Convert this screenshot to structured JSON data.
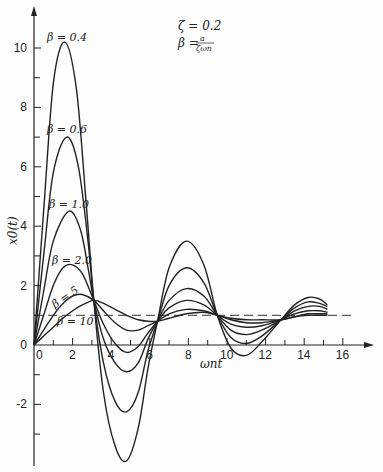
{
  "chart_data": {
    "type": "line",
    "title": "",
    "xlabel": "ωnt",
    "ylabel": "x0(t)",
    "xlim": [
      0,
      17
    ],
    "ylim": [
      -4,
      11
    ],
    "grid": false,
    "legend": "inline labels near first peaks",
    "x_ticks": [
      0,
      2,
      4,
      6,
      8,
      10,
      12,
      14,
      16
    ],
    "x_tick_labels": [
      "0",
      "2",
      "4",
      "6",
      "8",
      "10",
      "12",
      "14",
      "16"
    ],
    "y_ticks": [
      -2,
      0,
      2,
      4,
      6,
      8,
      10
    ],
    "y_tick_labels": [
      "-2",
      "0",
      "2",
      "4",
      "6",
      "8",
      "10"
    ],
    "annotations": [
      {
        "text": "ζ = 0.2",
        "position": "top-right"
      },
      {
        "text": "β = a / (ζωn)",
        "position": "top-right"
      }
    ],
    "reference_line": {
      "y": 1,
      "style": "dashed",
      "x_range": [
        0,
        16.5
      ]
    },
    "series": [
      {
        "name": "β = 0.4",
        "label": "β=0.4",
        "x": [
          0,
          0.5,
          1.0,
          1.6,
          2.2,
          2.7,
          3.1,
          3.6,
          4.2,
          4.8,
          5.4,
          5.9,
          6.4,
          7.0,
          7.9,
          8.8,
          9.5,
          10.2,
          11.0,
          11.8,
          12.8,
          13.5,
          14.2,
          14.8,
          15.2
        ],
        "y": [
          0,
          4.5,
          8.8,
          10.2,
          8.6,
          4.8,
          1.5,
          -1.6,
          -3.4,
          -3.9,
          -2.8,
          -0.8,
          0.8,
          2.6,
          3.5,
          2.7,
          1.0,
          -0.1,
          -0.35,
          0.1,
          0.85,
          1.35,
          1.6,
          1.55,
          1.35
        ]
      },
      {
        "name": "β = 0.6",
        "label": "β=0.6",
        "x": [
          0,
          0.5,
          1.0,
          1.7,
          2.3,
          2.8,
          3.1,
          3.6,
          4.2,
          4.8,
          5.4,
          5.9,
          6.4,
          7.0,
          7.9,
          8.8,
          9.5,
          10.2,
          11.0,
          11.8,
          12.8,
          13.5,
          14.2,
          14.8,
          15.2
        ],
        "y": [
          0,
          3.0,
          5.8,
          7.0,
          6.0,
          3.5,
          1.5,
          -0.6,
          -1.9,
          -2.25,
          -1.6,
          -0.2,
          0.8,
          2.0,
          2.6,
          2.1,
          1.0,
          0.25,
          0.05,
          0.3,
          0.85,
          1.25,
          1.45,
          1.4,
          1.3
        ]
      },
      {
        "name": "β = 1.0",
        "label": "β=1.0",
        "x": [
          0,
          0.5,
          1.0,
          1.8,
          2.4,
          2.8,
          3.1,
          3.6,
          4.2,
          4.8,
          5.4,
          5.9,
          6.4,
          7.0,
          7.9,
          8.8,
          9.5,
          10.2,
          11.0,
          11.8,
          12.8,
          13.5,
          14.2,
          14.8,
          15.2
        ],
        "y": [
          0,
          1.8,
          3.5,
          4.5,
          3.9,
          2.6,
          1.5,
          0.2,
          -0.6,
          -0.9,
          -0.6,
          0.2,
          0.8,
          1.5,
          1.9,
          1.65,
          1.0,
          0.5,
          0.35,
          0.5,
          0.85,
          1.15,
          1.3,
          1.3,
          1.2
        ]
      },
      {
        "name": "β = 2.0",
        "label": "β=2.0",
        "x": [
          0,
          0.5,
          1.0,
          1.5,
          2.0,
          2.5,
          3.1,
          3.6,
          4.2,
          4.8,
          5.4,
          5.9,
          6.4,
          7.0,
          7.9,
          8.8,
          9.5,
          10.2,
          11.0,
          11.8,
          12.8,
          13.5,
          14.2,
          14.8,
          15.2
        ],
        "y": [
          0,
          1.0,
          2.0,
          2.6,
          2.7,
          2.4,
          1.5,
          0.7,
          0.05,
          -0.25,
          -0.05,
          0.4,
          0.8,
          1.25,
          1.5,
          1.35,
          1.0,
          0.7,
          0.6,
          0.65,
          0.85,
          1.05,
          1.15,
          1.15,
          1.1
        ]
      },
      {
        "name": "β = 5",
        "label": "β=5",
        "x": [
          0,
          0.5,
          1.0,
          1.5,
          2.0,
          2.5,
          3.1,
          3.6,
          4.2,
          4.8,
          5.4,
          5.9,
          6.4,
          7.0,
          7.9,
          8.8,
          9.5,
          10.2,
          11.0,
          11.8,
          12.8,
          13.5,
          14.2,
          14.8,
          15.2
        ],
        "y": [
          0,
          0.5,
          1.0,
          1.4,
          1.65,
          1.7,
          1.5,
          1.15,
          0.75,
          0.5,
          0.5,
          0.65,
          0.8,
          1.05,
          1.2,
          1.15,
          1.0,
          0.85,
          0.75,
          0.75,
          0.85,
          0.95,
          1.05,
          1.05,
          1.05
        ]
      },
      {
        "name": "β = 10",
        "label": "β=10",
        "x": [
          0,
          0.5,
          1.0,
          1.5,
          2.0,
          2.5,
          3.1,
          3.6,
          4.2,
          4.8,
          5.4,
          5.9,
          6.4,
          7.0,
          7.9,
          8.8,
          9.5,
          10.2,
          11.0,
          11.8,
          12.8,
          13.5,
          14.2,
          14.8,
          15.2
        ],
        "y": [
          0,
          0.3,
          0.6,
          0.9,
          1.15,
          1.35,
          1.5,
          1.4,
          1.2,
          1.0,
          0.85,
          0.8,
          0.8,
          0.9,
          1.05,
          1.1,
          1.0,
          0.9,
          0.85,
          0.85,
          0.85,
          0.95,
          1.0,
          1.0,
          1.0
        ]
      }
    ]
  },
  "labels": {
    "annotation_zeta": "ζ = 0.2",
    "annotation_beta_lhs": "β =",
    "annotation_beta_num": "a",
    "annotation_beta_den": "ζωn",
    "xlabel": "ωnt",
    "ylabel": "x0(t)",
    "series_labels": [
      "β = 0.4",
      "β = 0.6",
      "β = 1.0",
      "β = 2.0",
      "β = 5",
      "β = 10"
    ]
  }
}
